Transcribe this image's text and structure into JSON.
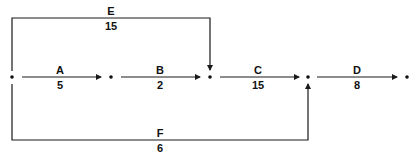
{
  "diagram": {
    "type": "activity-on-arrow network",
    "colors": {
      "line": "#1a1a1a",
      "background": "#ffffff"
    },
    "nodes": [
      {
        "id": "n1",
        "x": 12,
        "y": 77
      },
      {
        "id": "n2",
        "x": 111,
        "y": 77
      },
      {
        "id": "n3",
        "x": 210,
        "y": 77
      },
      {
        "id": "n4",
        "x": 308,
        "y": 77
      },
      {
        "id": "n5",
        "x": 407,
        "y": 77
      }
    ],
    "activities": [
      {
        "name": "A",
        "duration": "5",
        "from": "n1",
        "to": "n2"
      },
      {
        "name": "B",
        "duration": "2",
        "from": "n2",
        "to": "n3"
      },
      {
        "name": "C",
        "duration": "15",
        "from": "n3",
        "to": "n4"
      },
      {
        "name": "D",
        "duration": "8",
        "from": "n4",
        "to": "n5"
      },
      {
        "name": "E",
        "duration": "15",
        "from": "n1",
        "to": "n3"
      },
      {
        "name": "F",
        "duration": "6",
        "from": "n1",
        "to": "n4"
      }
    ]
  }
}
